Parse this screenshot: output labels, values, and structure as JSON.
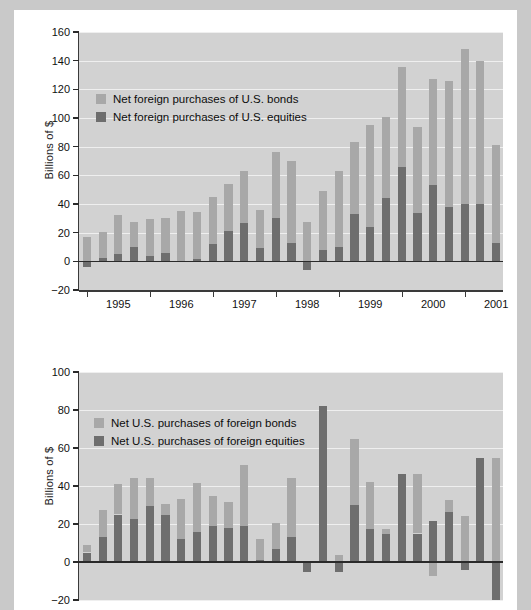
{
  "charts": [
    {
      "id": "top",
      "ylabel": "Billions of $",
      "ylim": [
        -20,
        160
      ],
      "yticks": [
        -20,
        0,
        20,
        40,
        60,
        80,
        100,
        120,
        140,
        160
      ],
      "ytick_labels": [
        "−20",
        "0",
        "20",
        "40",
        "60",
        "80",
        "100",
        "120",
        "140",
        "160"
      ],
      "xtick_labels": [
        "1995",
        "1996",
        "1997",
        "1998",
        "1999",
        "2000",
        "2001"
      ],
      "legend": [
        {
          "label": "Net foreign purchases of U.S. bonds",
          "color": "#a8a8a8",
          "key": "bonds"
        },
        {
          "label": "Net foreign purchases of U.S. equities",
          "color": "#6e6e6e",
          "key": "equities"
        }
      ]
    },
    {
      "id": "bottom",
      "ylabel": "Billions of $",
      "ylim": [
        -20,
        100
      ],
      "yticks": [
        -20,
        0,
        20,
        40,
        60,
        80,
        100
      ],
      "ytick_labels": [
        "−20",
        "0",
        "20",
        "40",
        "60",
        "80",
        "100"
      ],
      "xtick_labels": [],
      "legend": [
        {
          "label": "Net U.S. purchases of foreign bonds",
          "color": "#a8a8a8",
          "key": "bonds"
        },
        {
          "label": "Net U.S. purchases of foreign equities",
          "color": "#6e6e6e",
          "key": "equities"
        }
      ]
    }
  ],
  "chart_data": [
    {
      "type": "bar",
      "stacked": true,
      "title": "",
      "xlabel": "",
      "ylabel": "Billions of $",
      "ylim": [
        -20,
        160
      ],
      "yticks": [
        -20,
        0,
        20,
        40,
        60,
        80,
        100,
        120,
        140,
        160
      ],
      "grid": true,
      "legend_position": "upper-left",
      "categories": [
        "1994Q4",
        "1995Q1",
        "1995Q2",
        "1995Q3",
        "1995Q4",
        "1996Q1",
        "1996Q2",
        "1996Q3",
        "1996Q4",
        "1997Q1",
        "1997Q2",
        "1997Q3",
        "1997Q4",
        "1998Q1",
        "1998Q2",
        "1998Q3",
        "1998Q4",
        "1999Q1",
        "1999Q2",
        "1999Q3",
        "1999Q4",
        "2000Q1",
        "2000Q2",
        "2000Q3",
        "2000Q4",
        "2001Q1",
        "2001Q2"
      ],
      "series": [
        {
          "name": "Net foreign purchases of U.S. equities",
          "color": "#6e6e6e",
          "values": [
            -4,
            2,
            5,
            10,
            4,
            5.5,
            0.5,
            1.5,
            12,
            21.5,
            27,
            9,
            30,
            13,
            -6,
            8,
            10,
            33,
            24,
            44.5,
            65.5,
            33.5,
            53.5,
            38,
            40,
            40,
            12.5,
            33
          ]
        },
        {
          "name": "Net foreign purchases of U.S. bonds",
          "color": "#a8a8a8",
          "values": [
            17,
            20.5,
            32,
            27.5,
            29.5,
            30.5,
            35,
            34.5,
            45,
            54,
            63,
            35.5,
            76.5,
            70,
            27.5,
            49,
            63,
            83.5,
            95,
            101,
            135.5,
            94,
            127.5,
            126,
            148,
            139.5,
            81.5,
            125
          ]
        }
      ],
      "note": "Values are cumulative stacked totals: bonds value = top of stack, equities value = dark lower segment"
    },
    {
      "type": "bar",
      "stacked": true,
      "title": "",
      "xlabel": "",
      "ylabel": "Billions of $",
      "ylim": [
        -20,
        100
      ],
      "yticks": [
        -20,
        0,
        20,
        40,
        60,
        80,
        100
      ],
      "grid": true,
      "legend_position": "upper-left",
      "categories": [
        "1994Q4",
        "1995Q1",
        "1995Q2",
        "1995Q3",
        "1995Q4",
        "1996Q1",
        "1996Q2",
        "1996Q3",
        "1996Q4",
        "1997Q1",
        "1997Q2",
        "1997Q3",
        "1997Q4",
        "1998Q1",
        "1998Q2",
        "1998Q3",
        "1998Q4",
        "1999Q1",
        "1999Q2",
        "1999Q3",
        "1999Q4",
        "2000Q1",
        "2000Q2",
        "2000Q3",
        "2000Q4",
        "2001Q1",
        "2001Q2"
      ],
      "series": [
        {
          "name": "Net U.S. purchases of foreign equities",
          "color": "#6e6e6e",
          "values": [
            5,
            13,
            25,
            22.5,
            29.5,
            24.5,
            12,
            16,
            19,
            18,
            19,
            1,
            7,
            13,
            -5,
            82,
            -5.5,
            30,
            17.5,
            15,
            46.5,
            15,
            21.5,
            26.5,
            -4,
            55,
            -20,
            18
          ]
        },
        {
          "name": "Net U.S. purchases of foreign bonds",
          "color": "#a8a8a8",
          "values": [
            9,
            27.5,
            41,
            44,
            44,
            30.5,
            33,
            41.5,
            35,
            31.5,
            51,
            12,
            20.5,
            44,
            0,
            82,
            3.5,
            65,
            42,
            17.5,
            27,
            46.5,
            -7.5,
            32.5,
            24,
            30.5,
            55,
            -4,
            9.5,
            24.5
          ]
        }
      ],
      "note": "Stacked bars with some negative bond values extending below zero"
    }
  ]
}
